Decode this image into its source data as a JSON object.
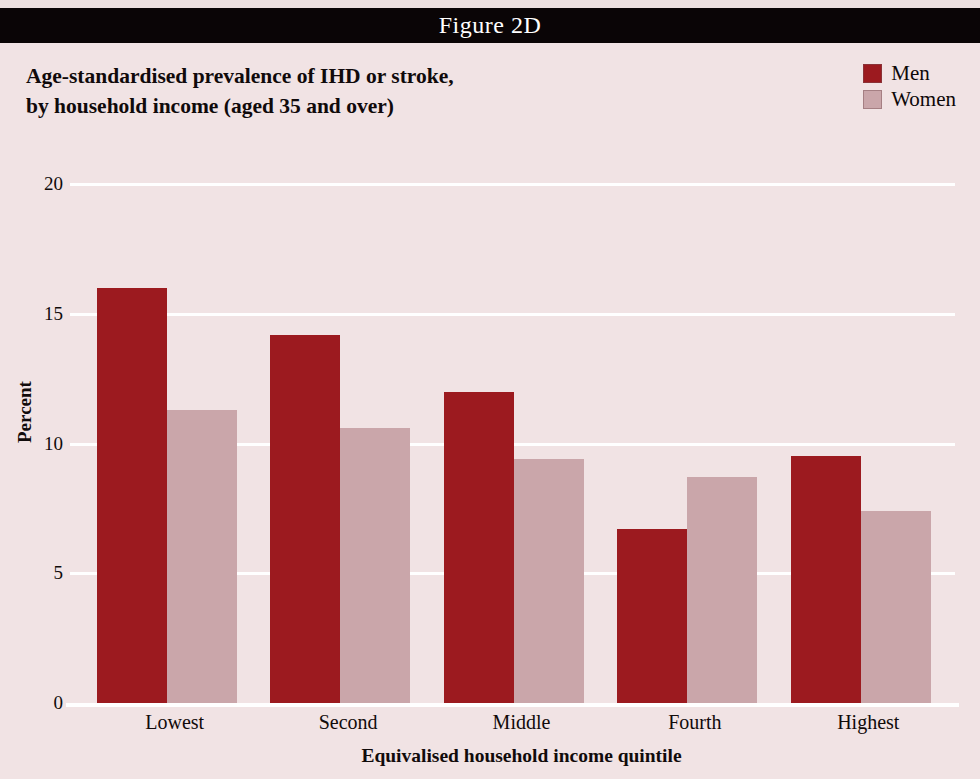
{
  "banner": {
    "figure_label": "Figure 2D"
  },
  "title": {
    "line1": "Age-standardised prevalence of IHD or stroke,",
    "line2": "by household income (aged 35 and over)"
  },
  "legend": {
    "position": "top-right",
    "entries": [
      {
        "label": "Men",
        "color": "#9c1a1f"
      },
      {
        "label": "Women",
        "color": "#caa6aa"
      }
    ]
  },
  "axes": {
    "y_title": "Percent",
    "x_title": "Equivalised household income quintile",
    "y_ticks": [
      "0",
      "5",
      "10",
      "15",
      "20"
    ]
  },
  "colors": {
    "banner_background": "#0a0506",
    "page_background": "#f1e3e4",
    "gridline": "#ffffff",
    "men": "#9c1a1f",
    "women": "#caa6aa",
    "text": "#110b0b"
  },
  "chart_data": {
    "type": "bar",
    "title": "Age-standardised prevalence of IHD or stroke, by household income (aged 35 and over)",
    "xlabel": "Equivalised household income quintile",
    "ylabel": "Percent",
    "ylim": [
      0,
      20
    ],
    "yticks": [
      0,
      5,
      10,
      15,
      20
    ],
    "grid": true,
    "legend_position": "top-right",
    "categories": [
      "Lowest",
      "Second",
      "Middle",
      "Fourth",
      "Highest"
    ],
    "series": [
      {
        "name": "Men",
        "color": "#9c1a1f",
        "values": [
          16.0,
          14.2,
          12.0,
          6.7,
          9.5
        ]
      },
      {
        "name": "Women",
        "color": "#caa6aa",
        "values": [
          11.3,
          10.6,
          9.4,
          8.7,
          7.4
        ]
      }
    ]
  }
}
